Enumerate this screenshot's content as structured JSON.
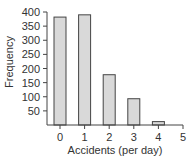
{
  "chart_data": {
    "type": "bar",
    "title": "",
    "xlabel": "Accidents (per day)",
    "ylabel": "Frequency",
    "categories": [
      "0",
      "1",
      "2",
      "3",
      "4",
      "5"
    ],
    "values": [
      382,
      390,
      178,
      93,
      12,
      0
    ],
    "ylim": [
      0,
      400
    ],
    "yticks": [
      50,
      100,
      150,
      200,
      250,
      300,
      350,
      400
    ],
    "xticks": [
      "0",
      "1",
      "2",
      "3",
      "4",
      "5"
    ],
    "grid": false,
    "legend": null,
    "colors": {
      "bar_fill": "#d9d9d9",
      "bar_stroke": "#444444",
      "axis": "#444444"
    }
  }
}
